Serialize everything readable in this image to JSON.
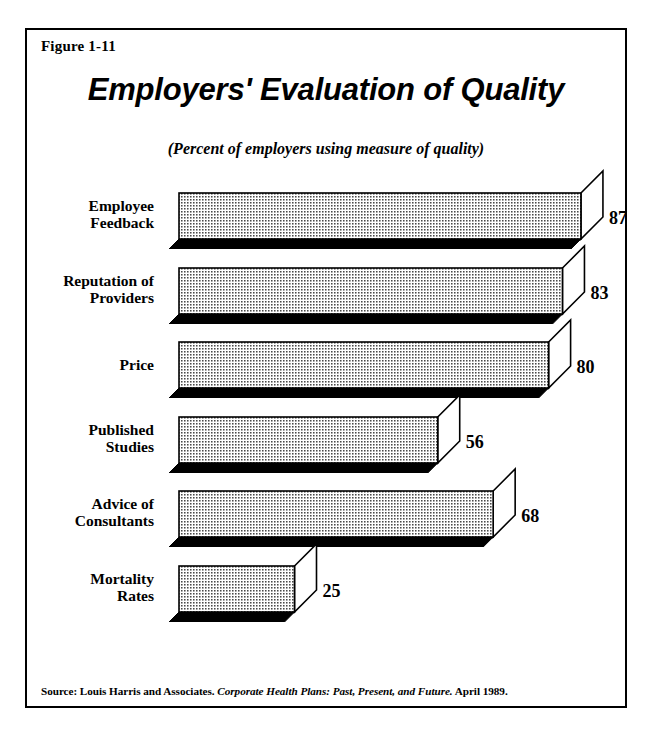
{
  "figure": {
    "number_label": "Figure 1-11",
    "title": "Employers' Evaluation of Quality",
    "subtitle": "(Percent of employers using measure of quality)",
    "source_prefix": "Source: Louis Harris and Associates.",
    "source_italic": "Corporate Health Plans: Past, Present, and Future.",
    "source_suffix": "April 1989."
  },
  "colors": {
    "frame": "#000000",
    "bar_face": "#d8d8d8",
    "bar_shadow": "#000000",
    "bar_side": "#ffffff",
    "background": "#ffffff",
    "text": "#000000"
  },
  "chart_data": {
    "type": "bar",
    "orientation": "horizontal",
    "style": "3d-isometric",
    "title": "Employers' Evaluation of Quality",
    "subtitle": "(Percent of employers using measure of quality)",
    "xlabel": "",
    "ylabel": "",
    "unit": "percent",
    "xlim": [
      0,
      100
    ],
    "grid": false,
    "legend": "none",
    "categories": [
      "Employee Feedback",
      "Reputation of Providers",
      "Price",
      "Published Studies",
      "Advice of Consultants",
      "Mortality Rates"
    ],
    "values": [
      87,
      83,
      80,
      56,
      68,
      25
    ],
    "bars": [
      {
        "label": "Employee\nFeedback",
        "value": 87,
        "value_text": "87"
      },
      {
        "label": "Reputation of\nProviders",
        "value": 83,
        "value_text": "83"
      },
      {
        "label": "Price",
        "value": 80,
        "value_text": "80"
      },
      {
        "label": "Published\nStudies",
        "value": 56,
        "value_text": "56"
      },
      {
        "label": "Advice of\nConsultants",
        "value": 68,
        "value_text": "68"
      },
      {
        "label": "Mortality\nRates",
        "value": 25,
        "value_text": "25"
      }
    ]
  }
}
